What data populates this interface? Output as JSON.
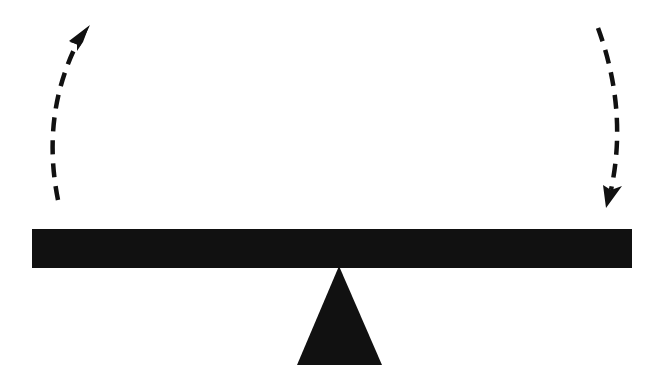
{
  "diagram": {
    "type": "seesaw-balance",
    "background": "#ffffff",
    "ink": "#111111",
    "beam": {
      "x": 32,
      "y": 229,
      "width": 600,
      "height": 39
    },
    "fulcrum": {
      "apex": [
        339,
        268
      ],
      "base_left": [
        297,
        365
      ],
      "base_right": [
        382,
        365
      ]
    },
    "arrows": [
      {
        "name": "left-arrow",
        "direction": "up",
        "style": "dashed",
        "path": "M 58 200 Q 42 110 80 38",
        "tip": [
          88,
          27
        ]
      },
      {
        "name": "right-arrow",
        "direction": "down",
        "style": "dashed",
        "path": "M 598 28 Q 626 110 609 193",
        "tip": [
          607,
          207
        ]
      }
    ]
  }
}
